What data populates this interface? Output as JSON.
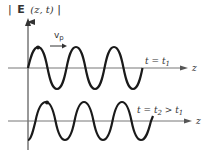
{
  "diagram": {
    "y_axis_label": {
      "bar_left": "|",
      "symbol": "E",
      "args": "(z, t)",
      "bar_right": "|"
    },
    "velocity_label": {
      "symbol": "v",
      "subscript": "p"
    },
    "top_panel": {
      "time_label": "t = t",
      "time_subscript": "1",
      "axis_label": "z"
    },
    "bottom_panel": {
      "time_label_a": "t = t",
      "time_subscript_a": "2",
      "time_label_b": " > t",
      "time_subscript_b": "1",
      "axis_label": "z"
    },
    "colors": {
      "wave": "#1a1a1a",
      "axis": "#555555",
      "text": "#333333"
    },
    "wave_params": {
      "period_px": 38,
      "amplitude_px": 21,
      "phase_shift_px": 10
    }
  }
}
